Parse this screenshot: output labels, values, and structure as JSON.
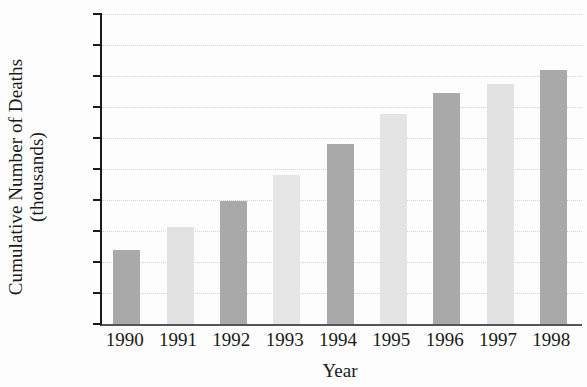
{
  "chart_data": {
    "type": "bar",
    "title": "",
    "xlabel": "Year",
    "ylabel": "Cumulative Number of Deaths (thousands)",
    "ylabel_lines": [
      "Cumulative Number of Deaths",
      "(thousands)"
    ],
    "categories": [
      "1990",
      "1991",
      "1992",
      "1993",
      "1994",
      "1995",
      "1996",
      "1997",
      "1998"
    ],
    "values": [
      120,
      157,
      198,
      240,
      290,
      338,
      372,
      387,
      410
    ],
    "ylim": [
      0,
      500
    ],
    "y_ticks": [
      0,
      50,
      100,
      150,
      200,
      250,
      300,
      350,
      400,
      450,
      500
    ],
    "y_tick_labels": [
      "0",
      "50",
      "100",
      "150",
      "200",
      "250",
      "300",
      "350",
      "400",
      "450",
      "500"
    ],
    "grid": true,
    "legend": false,
    "bar_colors": [
      "#a9a9a9",
      "#e2e2e2",
      "#a9a9a9",
      "#e6e6e6",
      "#a9a9a9",
      "#e4e4e4",
      "#a9a9a9",
      "#e2e2e2",
      "#a9a9a9"
    ]
  }
}
